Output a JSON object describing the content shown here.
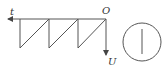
{
  "diagram": {
    "type": "sawtooth-voltage-waveform",
    "labels": {
      "time_axis": "t",
      "origin": "O",
      "voltage_axis": "U"
    },
    "teeth_count": 3,
    "stroke_color": "#555555",
    "symbol": "circle-with-vertical-line"
  }
}
